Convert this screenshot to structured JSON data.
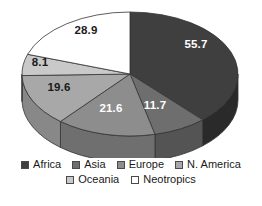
{
  "chart_data": {
    "type": "pie",
    "title": "",
    "subtitle": "",
    "xlabel": "",
    "ylabel": "",
    "grid": false,
    "legend_position": "bottom",
    "three_d": true,
    "categories": [
      "Africa",
      "Asia",
      "Europe",
      "N. America",
      "Oceania",
      "Neotropics"
    ],
    "values": [
      55.7,
      11.7,
      21.6,
      19.6,
      8.1,
      28.9
    ],
    "data_labels": [
      "55.7",
      "11.7",
      "21.6",
      "19.6",
      "8.1",
      "28.9"
    ],
    "total": 145.6,
    "colors": [
      "#3f3f3f",
      "#6e6e6e",
      "#8d8d8d",
      "#a8a8a8",
      "#c9c9c9",
      "#ffffff"
    ],
    "side_colors": [
      "#2a2a2a",
      "#545454",
      "#6f6f6f",
      "#888888",
      "#a5a5a5",
      "#d8d8d8"
    ],
    "slices": [
      {
        "label": "Africa",
        "value": 55.7,
        "data_label": "55.7",
        "color": "#3f3f3f",
        "side_color": "#2a2a2a",
        "label_color": "#ffffff"
      },
      {
        "label": "Asia",
        "value": 11.7,
        "data_label": "11.7",
        "color": "#6e6e6e",
        "side_color": "#545454",
        "label_color": "#ffffff"
      },
      {
        "label": "Europe",
        "value": 21.6,
        "data_label": "21.6",
        "color": "#8d8d8d",
        "side_color": "#6f6f6f",
        "label_color": "#ffffff"
      },
      {
        "label": "N. America",
        "value": 19.6,
        "data_label": "19.6",
        "color": "#a8a8a8",
        "side_color": "#888888",
        "label_color": "#1a1a1a"
      },
      {
        "label": "Oceania",
        "value": 8.1,
        "data_label": "8.1",
        "color": "#c9c9c9",
        "side_color": "#a5a5a5",
        "label_color": "#1a1a1a"
      },
      {
        "label": "Neotropics",
        "value": 28.9,
        "data_label": "28.9",
        "color": "#ffffff",
        "side_color": "#d8d8d8",
        "label_color": "#1a1a1a"
      }
    ]
  },
  "legend": {
    "row1": [
      {
        "label": "Africa",
        "color": "#3f3f3f"
      },
      {
        "label": "Asia",
        "color": "#6e6e6e"
      },
      {
        "label": "Europe",
        "color": "#8d8d8d"
      },
      {
        "label": "N. America",
        "color": "#a8a8a8"
      }
    ],
    "row2": [
      {
        "label": "Oceania",
        "color": "#c9c9c9"
      },
      {
        "label": "Neotropics",
        "color": "#ffffff"
      }
    ]
  },
  "labels": {
    "africa": "55.7",
    "asia": "11.7",
    "europe": "21.6",
    "namerica": "19.6",
    "oceania": "8.1",
    "neotropics": "28.9"
  }
}
